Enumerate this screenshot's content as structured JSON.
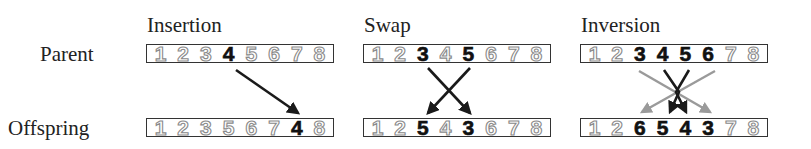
{
  "row_labels": {
    "parent": "Parent",
    "offspring": "Offspring"
  },
  "operators": [
    {
      "name": "Insertion",
      "parent": [
        {
          "v": "1",
          "hl": false
        },
        {
          "v": "2",
          "hl": false
        },
        {
          "v": "3",
          "hl": false
        },
        {
          "v": "4",
          "hl": true
        },
        {
          "v": "5",
          "hl": false
        },
        {
          "v": "6",
          "hl": false
        },
        {
          "v": "7",
          "hl": false
        },
        {
          "v": "8",
          "hl": false
        }
      ],
      "offspring": [
        {
          "v": "1",
          "hl": false
        },
        {
          "v": "2",
          "hl": false
        },
        {
          "v": "3",
          "hl": false
        },
        {
          "v": "5",
          "hl": false
        },
        {
          "v": "6",
          "hl": false
        },
        {
          "v": "7",
          "hl": false
        },
        {
          "v": "4",
          "hl": true
        },
        {
          "v": "8",
          "hl": false
        }
      ]
    },
    {
      "name": "Swap",
      "parent": [
        {
          "v": "1",
          "hl": false
        },
        {
          "v": "2",
          "hl": false
        },
        {
          "v": "3",
          "hl": true
        },
        {
          "v": "4",
          "hl": false
        },
        {
          "v": "5",
          "hl": true
        },
        {
          "v": "6",
          "hl": false
        },
        {
          "v": "7",
          "hl": false
        },
        {
          "v": "8",
          "hl": false
        }
      ],
      "offspring": [
        {
          "v": "1",
          "hl": false
        },
        {
          "v": "2",
          "hl": false
        },
        {
          "v": "5",
          "hl": true
        },
        {
          "v": "4",
          "hl": false
        },
        {
          "v": "3",
          "hl": true
        },
        {
          "v": "6",
          "hl": false
        },
        {
          "v": "7",
          "hl": false
        },
        {
          "v": "8",
          "hl": false
        }
      ]
    },
    {
      "name": "Inversion",
      "parent": [
        {
          "v": "1",
          "hl": false
        },
        {
          "v": "2",
          "hl": false
        },
        {
          "v": "3",
          "hl": true
        },
        {
          "v": "4",
          "hl": true
        },
        {
          "v": "5",
          "hl": true
        },
        {
          "v": "6",
          "hl": true
        },
        {
          "v": "7",
          "hl": false
        },
        {
          "v": "8",
          "hl": false
        }
      ],
      "offspring": [
        {
          "v": "1",
          "hl": false
        },
        {
          "v": "2",
          "hl": false
        },
        {
          "v": "6",
          "hl": true
        },
        {
          "v": "5",
          "hl": true
        },
        {
          "v": "4",
          "hl": true
        },
        {
          "v": "3",
          "hl": true
        },
        {
          "v": "7",
          "hl": false
        },
        {
          "v": "8",
          "hl": false
        }
      ]
    }
  ],
  "colors": {
    "arrow_dark": "#1a1a1a",
    "arrow_gray": "#9a9a9a",
    "gene_outline": "#8a8a8a",
    "gene_highlight": "#111111"
  }
}
